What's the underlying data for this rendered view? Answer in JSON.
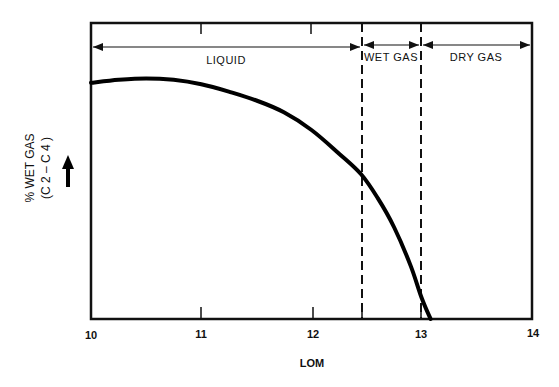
{
  "chart_data": {
    "type": "line",
    "title": "",
    "xlabel": "LOM",
    "ylabel": "% WET GAS (C2 – C4)",
    "ylabel_line1": "% WET GAS",
    "ylabel_line2": "(C 2 – C 4 )",
    "xlim": [
      10,
      14
    ],
    "ylim": [
      0,
      1
    ],
    "x_ticks": [
      "10",
      "11",
      "12",
      "13",
      "14"
    ],
    "grid": false,
    "legend": null,
    "series": [
      {
        "name": "% wet gas",
        "x": [
          10.0,
          10.25,
          10.5,
          10.75,
          11.0,
          11.25,
          11.5,
          11.75,
          12.0,
          12.25,
          12.45,
          12.6,
          12.75,
          12.9,
          13.0,
          13.08
        ],
        "y": [
          0.8,
          0.81,
          0.815,
          0.81,
          0.795,
          0.77,
          0.74,
          0.7,
          0.64,
          0.56,
          0.49,
          0.41,
          0.31,
          0.18,
          0.07,
          0.0
        ]
      }
    ],
    "vertical_markers": [
      {
        "x": 12.45,
        "style": "dashed"
      },
      {
        "x": 13.0,
        "style": "dashed"
      }
    ],
    "zones": [
      {
        "label": "LIQUID",
        "from": 10,
        "to": 12.45
      },
      {
        "label": "WET GAS",
        "from": 12.45,
        "to": 13.0
      },
      {
        "label": "DRY GAS",
        "from": 13.0,
        "to": 14
      }
    ],
    "annotations": [
      "y-axis arrow pointing up (increasing)"
    ]
  },
  "labels": {
    "x_ticks": [
      "10",
      "11",
      "12",
      "13",
      "14"
    ],
    "xlabel": "LOM",
    "ylabel_line1": "% WET GAS",
    "ylabel_line2": "(C 2 – C 4 )",
    "zones": [
      "LIQUID",
      "WET GAS",
      "DRY GAS"
    ]
  }
}
